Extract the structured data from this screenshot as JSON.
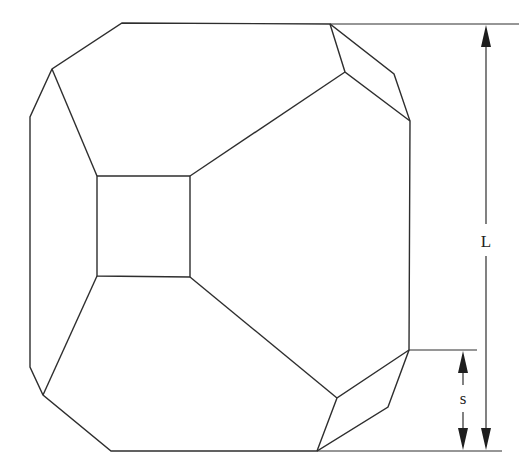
{
  "diagram": {
    "labels": {
      "length": "L",
      "side": "s"
    },
    "dimensions": [
      {
        "name": "length",
        "label": "L",
        "from_y": 24,
        "to_y": 451
      },
      {
        "name": "side",
        "label": "s",
        "from_y": 350,
        "to_y": 451
      }
    ],
    "colors": {
      "line": "#2e2e2e",
      "background": "#ffffff"
    }
  }
}
